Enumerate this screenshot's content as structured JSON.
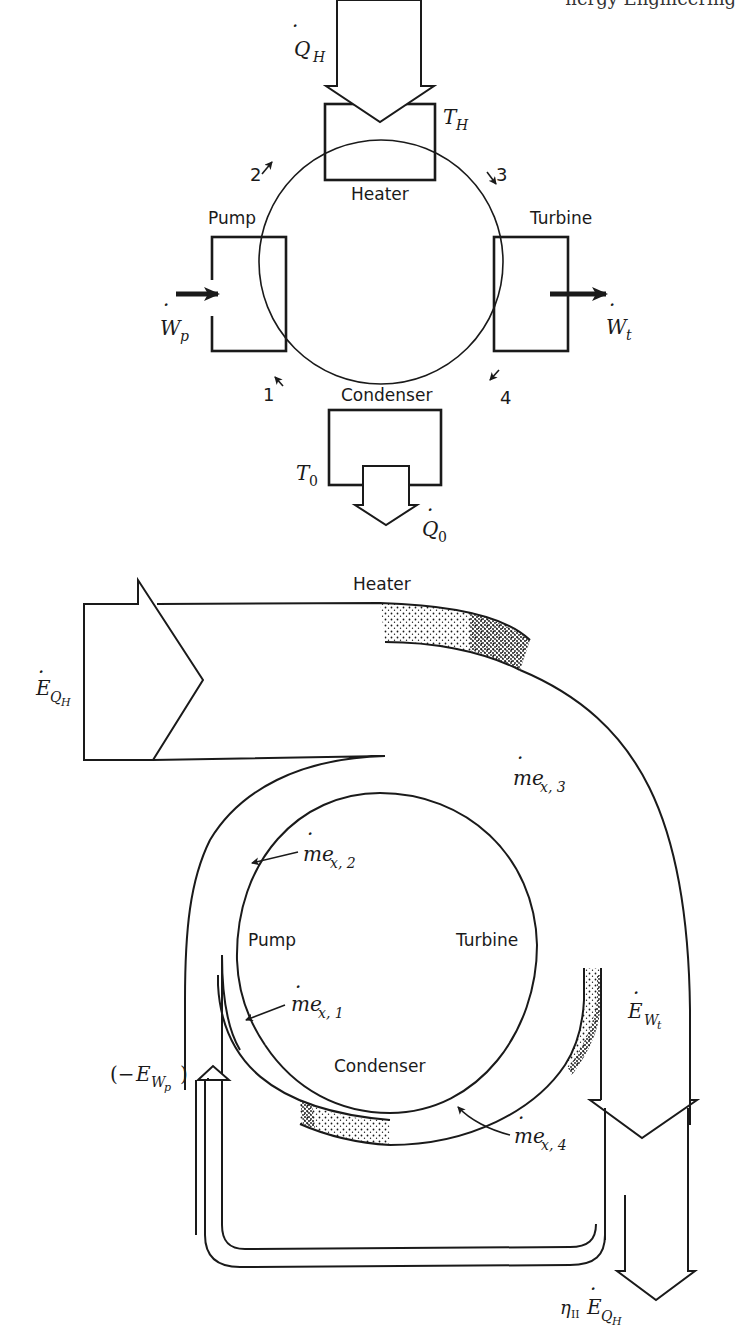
{
  "page": {
    "header_fragment": "nergy Engineering"
  },
  "cycle_schematic": {
    "components": {
      "heater": "Heater",
      "pump": "Pump",
      "turbine": "Turbine",
      "condenser": "Condenser"
    },
    "states": [
      "1",
      "2",
      "3",
      "4"
    ],
    "heat_in": {
      "symbol": "Q",
      "dot": "·",
      "subscript": "H"
    },
    "heat_out": {
      "symbol": "Q",
      "dot": "·",
      "subscript": "0"
    },
    "hot_temp": {
      "symbol": "T",
      "subscript": "H"
    },
    "cold_temp": {
      "symbol": "T",
      "subscript": "0"
    },
    "pump_work": {
      "symbol": "W",
      "dot": "·",
      "subscript": "p"
    },
    "turbine_work": {
      "symbol": "W",
      "dot": "·",
      "subscript": "t"
    }
  },
  "exergy_diagram": {
    "components": {
      "heater": "Heater",
      "pump": "Pump",
      "turbine": "Turbine",
      "condenser": "Condenser"
    },
    "exergy_in": {
      "symbol": "E",
      "dot": "·",
      "subscript": "Q",
      "subsubscript": "H"
    },
    "flows": [
      {
        "id": "mex1",
        "symbol": "me",
        "dot": "·",
        "subscript": "x, 1"
      },
      {
        "id": "mex2",
        "symbol": "me",
        "dot": "·",
        "subscript": "x, 2"
      },
      {
        "id": "mex3",
        "symbol": "me",
        "dot": "·",
        "subscript": "x, 3"
      },
      {
        "id": "mex4",
        "symbol": "me",
        "dot": "·",
        "subscript": "x, 4"
      }
    ],
    "pump_exergy": {
      "prefix": "(−",
      "symbol": "E",
      "subscript": "W",
      "subsubscript": "p",
      "suffix": ")"
    },
    "turbine_exergy": {
      "symbol": "E",
      "dot": "·",
      "subscript": "W",
      "subsubscript": "t"
    },
    "net_output": {
      "eta": "η",
      "eta_sub": "II",
      "symbol": "E",
      "dot": "·",
      "subscript": "Q",
      "subsubscript": "H"
    }
  }
}
